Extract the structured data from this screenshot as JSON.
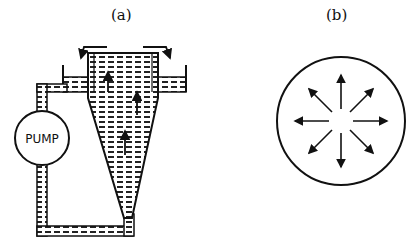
{
  "panels": [
    {
      "label": "(a)",
      "pump_label": "PUMP",
      "description": "hydrocyclone with pump recirculation, upward flow arrows"
    },
    {
      "label": "(b)",
      "description": "circle with eight radially outward arrows"
    }
  ],
  "colors": {
    "ink": "#111111",
    "background": "#ffffff"
  }
}
